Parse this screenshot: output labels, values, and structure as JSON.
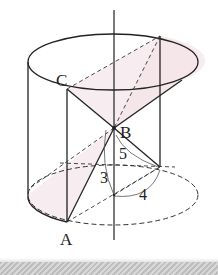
{
  "diagram": {
    "labels": {
      "C": "C",
      "B": "B",
      "A": "A",
      "slant": "5",
      "height": "3",
      "radius": "4"
    },
    "colors": {
      "line": "#222222",
      "shade": "#f5e9ec",
      "background": "#ffffff"
    }
  }
}
